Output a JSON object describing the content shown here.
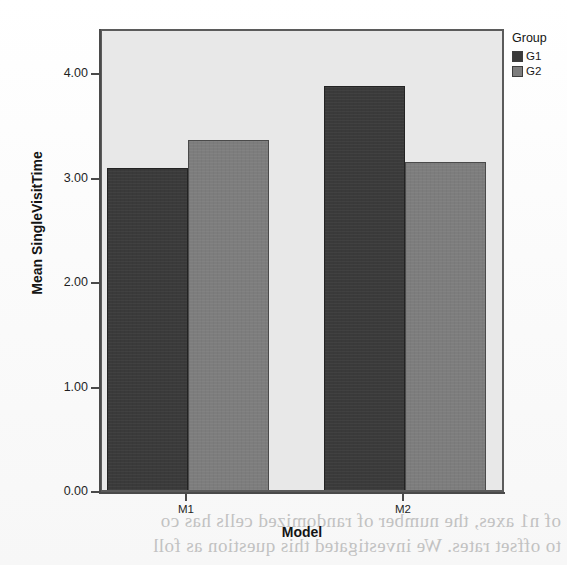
{
  "chart_data": {
    "type": "bar",
    "title": "",
    "xlabel": "Model",
    "ylabel": "Mean SingleVisitTime",
    "categories": [
      "M1",
      "M2"
    ],
    "series": [
      {
        "name": "G1",
        "values": [
          3.08,
          3.87
        ],
        "color": "#3a3a3a"
      },
      {
        "name": "G2",
        "values": [
          3.35,
          3.14
        ],
        "color": "#7d7d7d"
      }
    ],
    "ylim": [
      0.0,
      4.43
    ],
    "yticks": [
      "0.00",
      "1.00",
      "2.00",
      "3.00",
      "4.00"
    ],
    "ytick_values": [
      0.0,
      1.0,
      2.0,
      3.0,
      4.0
    ],
    "grid": false,
    "legend": {
      "title": "Group",
      "position": "right",
      "entries": [
        {
          "label": "G1",
          "color": "#3a3a3a"
        },
        {
          "label": "G2",
          "color": "#7d7d7d"
        }
      ]
    },
    "plot_background": "#e8e8e8",
    "axis_color": "#4a4a4a"
  },
  "axes": {
    "y_title": "Mean SingleVisitTime",
    "x_title": "Model",
    "y_labels": [
      "4.00",
      "3.00",
      "2.00",
      "1.00",
      "0.00"
    ],
    "x_labels": [
      "M1",
      "M2"
    ]
  },
  "legend": {
    "title": "Group",
    "items": [
      {
        "label": "G1"
      },
      {
        "label": "G2"
      }
    ]
  },
  "bars": [
    {
      "name": "bar-m1-g1",
      "group": "G1",
      "category": "M1",
      "value": 3.08
    },
    {
      "name": "bar-m1-g2",
      "group": "G2",
      "category": "M1",
      "value": 3.35
    },
    {
      "name": "bar-m2-g1",
      "group": "G1",
      "category": "M2",
      "value": 3.87
    },
    {
      "name": "bar-m2-g2",
      "group": "G2",
      "category": "M2",
      "value": 3.14
    }
  ],
  "background_text": {
    "line1": "of n1 axes, the number of randomized cells has co",
    "line2": "to offset rates. We investigated this question as foll"
  }
}
